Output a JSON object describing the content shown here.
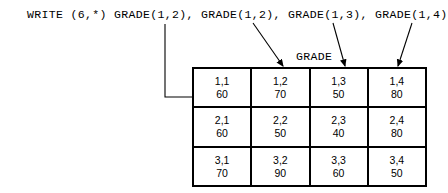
{
  "code": {
    "statement": "WRITE (6,*) GRADE(1,2), GRADE(1,2), GRADE(1,3), GRADE(1,4)"
  },
  "caption": {
    "array_name": "GRADE"
  },
  "table": {
    "rows": [
      [
        {
          "index": "1,1",
          "value": "60"
        },
        {
          "index": "1,2",
          "value": "70"
        },
        {
          "index": "1,3",
          "value": "50"
        },
        {
          "index": "1,4",
          "value": "80"
        }
      ],
      [
        {
          "index": "2,1",
          "value": "60"
        },
        {
          "index": "2,2",
          "value": "50"
        },
        {
          "index": "2,3",
          "value": "40"
        },
        {
          "index": "2,4",
          "value": "80"
        }
      ],
      [
        {
          "index": "3,1",
          "value": "70"
        },
        {
          "index": "3,2",
          "value": "90"
        },
        {
          "index": "3,3",
          "value": "60"
        },
        {
          "index": "3,4",
          "value": "50"
        }
      ]
    ]
  },
  "connectors": [
    {
      "name": "arrow-to-cell-1-1",
      "from_label": "GRADE(1,2)",
      "to_cell": "1,1",
      "style": "elbow"
    },
    {
      "name": "arrow-to-cell-1-2",
      "from_label": "GRADE(1,2)",
      "to_cell": "1,2",
      "style": "diagonal"
    },
    {
      "name": "arrow-to-cell-1-3",
      "from_label": "GRADE(1,3)",
      "to_cell": "1,3",
      "style": "diagonal"
    },
    {
      "name": "arrow-to-cell-1-4",
      "from_label": "GRADE(1,4)",
      "to_cell": "1,4",
      "style": "diagonal"
    }
  ],
  "colors": {
    "ink": "#000000",
    "background": "#ffffff"
  }
}
